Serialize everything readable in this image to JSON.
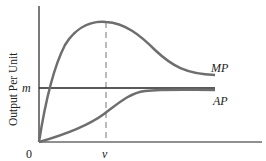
{
  "diagram": {
    "type": "economics-curves",
    "y_axis_label": "Output Per Unit",
    "origin_label": "0",
    "x_marker_label": "v",
    "y_marker_label": "m",
    "curves": [
      {
        "name": "MP",
        "label": "MP",
        "color": "#6e6e6e",
        "description": "rises to peak at v, then declines toward asymptote above m"
      },
      {
        "name": "AP",
        "label": "AP",
        "color": "#6e6e6e",
        "description": "S-shaped, rises from origin and levels off just below m"
      }
    ],
    "horizontal_line": {
      "label": "m",
      "color": "#222222"
    },
    "vertical_dashed_line": {
      "label": "v",
      "color": "#777777"
    }
  }
}
